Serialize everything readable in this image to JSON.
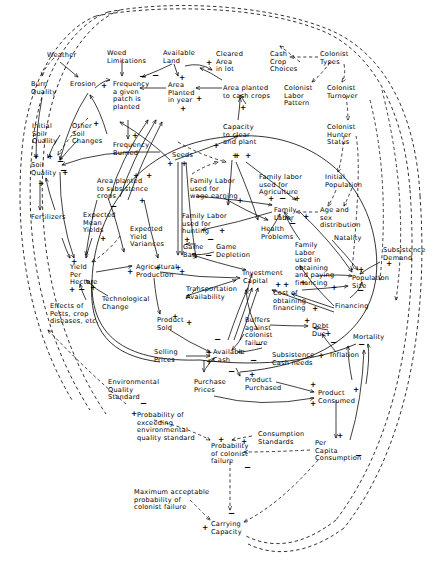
{
  "diagram": {
    "type": "causal-loop-diagram",
    "width": 439,
    "height": 562,
    "link_styles": {
      "causal": "solid",
      "informational": "dashed"
    },
    "polarity_symbols": [
      "+",
      "−"
    ],
    "nodes": [
      {
        "id": "weather",
        "label": "Weather",
        "x": 47,
        "y": 52,
        "align": "left"
      },
      {
        "id": "weed-limitations",
        "label": "Weed\nLimitations",
        "x": 107,
        "y": 50,
        "align": "left"
      },
      {
        "id": "available-land",
        "label": "Available\nLand",
        "x": 163,
        "y": 50,
        "align": "left"
      },
      {
        "id": "cleared-area-in-lot",
        "label": "Cleared\nArea\nin lot",
        "x": 216,
        "y": 51,
        "align": "left"
      },
      {
        "id": "cash-crop-choices",
        "label": "Cash\nCrop\nChoices",
        "x": 270,
        "y": 51,
        "align": "left"
      },
      {
        "id": "colonist-types",
        "label": "Colonist\nTypes",
        "x": 320,
        "y": 51,
        "align": "left"
      },
      {
        "id": "burn-quality",
        "label": "Burn\nQuality",
        "x": 31,
        "y": 81,
        "align": "left"
      },
      {
        "id": "erosion",
        "label": "Erosion",
        "x": 70,
        "y": 81,
        "align": "left"
      },
      {
        "id": "frequency-planted",
        "label": "Frequency\na given\npatch is\nplanted",
        "x": 113,
        "y": 81,
        "align": "left"
      },
      {
        "id": "area-planted-in-year",
        "label": "Area\nPlanted\nin year",
        "x": 168,
        "y": 82,
        "align": "left"
      },
      {
        "id": "area-planted-cash-crops",
        "label": "Area planted\nto cash crops",
        "x": 223,
        "y": 85,
        "align": "left"
      },
      {
        "id": "colonist-labor-pattern",
        "label": "Colonist\nLabor\nPattern",
        "x": 284,
        "y": 85,
        "align": "left"
      },
      {
        "id": "colonist-turnover",
        "label": "Colonist\nTurnover",
        "x": 327,
        "y": 85,
        "align": "left"
      },
      {
        "id": "initial-soil-quality",
        "label": "Initial\nSoil\nQuality",
        "x": 32,
        "y": 123,
        "align": "left"
      },
      {
        "id": "other-soil-changes",
        "label": "Other\nSoil\nChanges",
        "x": 72,
        "y": 123,
        "align": "left"
      },
      {
        "id": "frequency-burned",
        "label": "Frequency\nBurned",
        "x": 113,
        "y": 142,
        "align": "left"
      },
      {
        "id": "capacity-clear-plant",
        "label": "Capacity\nto clear\nand plant",
        "x": 223,
        "y": 124,
        "align": "left"
      },
      {
        "id": "colonist-hunter-status",
        "label": "Colonist\nHunter\nStatus",
        "x": 327,
        "y": 124,
        "align": "left"
      },
      {
        "id": "seeds",
        "label": "Seeds",
        "x": 172,
        "y": 152,
        "align": "left"
      },
      {
        "id": "soil-quality",
        "label": "Soil\nQuality",
        "x": 31,
        "y": 162,
        "align": "left"
      },
      {
        "id": "area-planted-subsistence",
        "label": "Area planted\nto subsistence\ncrops",
        "x": 97,
        "y": 178,
        "align": "left"
      },
      {
        "id": "family-labor-wage",
        "label": "Family Labor\nused for\nwage earning",
        "x": 190,
        "y": 178,
        "align": "left"
      },
      {
        "id": "family-labor-agriculture",
        "label": "Family labor\nused for\nAgriculture",
        "x": 259,
        "y": 174,
        "align": "left"
      },
      {
        "id": "initial-population",
        "label": "Initial\nPopulation",
        "x": 325,
        "y": 174,
        "align": "left"
      },
      {
        "id": "fertilizers",
        "label": "Fertilizers",
        "x": 31,
        "y": 214,
        "align": "left"
      },
      {
        "id": "expected-mean-yields",
        "label": "Expected\nMean\nYields",
        "x": 83,
        "y": 212,
        "align": "left"
      },
      {
        "id": "family-labor-hunting",
        "label": "Family Labor\nused for\nhunting",
        "x": 182,
        "y": 213,
        "align": "left"
      },
      {
        "id": "family-labor",
        "label": "Family\nLabor",
        "x": 274,
        "y": 207,
        "align": "left"
      },
      {
        "id": "age-sex-distribution",
        "label": "Age and\nsex\ndistribution",
        "x": 320,
        "y": 207,
        "align": "left"
      },
      {
        "id": "expected-yield-variances",
        "label": "Expected\nYield\nVariances",
        "x": 130,
        "y": 226,
        "align": "left"
      },
      {
        "id": "health-problems",
        "label": "Health\nProblems",
        "x": 261,
        "y": 226,
        "align": "left"
      },
      {
        "id": "natality",
        "label": "Natality",
        "x": 334,
        "y": 235,
        "align": "left"
      },
      {
        "id": "game-bag",
        "label": "Game\nBag",
        "x": 183,
        "y": 244,
        "align": "left"
      },
      {
        "id": "game-depletion",
        "label": "Game\nDepletion",
        "x": 216,
        "y": 244,
        "align": "left"
      },
      {
        "id": "family-labor-financing",
        "label": "Family\nLabor\nused in\nobtaining\nand paying\nfinancing",
        "x": 295,
        "y": 242,
        "align": "left"
      },
      {
        "id": "subsistence-demand",
        "label": "Subsistence\nDemand",
        "x": 383,
        "y": 247,
        "align": "left"
      },
      {
        "id": "yield-per-hectare",
        "label": "Yield\nPer\nHectare",
        "x": 70,
        "y": 264,
        "align": "left"
      },
      {
        "id": "agricultural-production",
        "label": "Agricultural\nProduction",
        "x": 136,
        "y": 264,
        "align": "left"
      },
      {
        "id": "investment-capital",
        "label": "Investment\nCapital",
        "x": 243,
        "y": 270,
        "align": "left"
      },
      {
        "id": "population-size",
        "label": "Population\nSize",
        "x": 352,
        "y": 275,
        "align": "left"
      },
      {
        "id": "technological-change",
        "label": "Technological\nChange",
        "x": 102,
        "y": 296,
        "align": "left"
      },
      {
        "id": "transportation-availability",
        "label": "Transportation\nAvailability",
        "x": 186,
        "y": 286,
        "align": "left"
      },
      {
        "id": "cost-obtaining-financing",
        "label": "Cost of\nobtaining\nfinancing",
        "x": 273,
        "y": 290,
        "align": "left"
      },
      {
        "id": "financing",
        "label": "Financing",
        "x": 335,
        "y": 303,
        "align": "left"
      },
      {
        "id": "effects-pests",
        "label": "Effects of\nPests, crop\ndiseases, etc.",
        "x": 50,
        "y": 303,
        "align": "left"
      },
      {
        "id": "buffers-against-failure",
        "label": "Buffers\nagainst\ncolonist\nfailure",
        "x": 245,
        "y": 317,
        "align": "left"
      },
      {
        "id": "debt-due",
        "label": "Debt\nDue",
        "x": 312,
        "y": 323,
        "align": "left"
      },
      {
        "id": "product-sold",
        "label": "Product\nSold",
        "x": 157,
        "y": 317,
        "align": "left"
      },
      {
        "id": "mortality",
        "label": "Mortality",
        "x": 353,
        "y": 334,
        "align": "left"
      },
      {
        "id": "selling-prices",
        "label": "Selling\nPrices",
        "x": 154,
        "y": 349,
        "align": "left"
      },
      {
        "id": "available-cash",
        "label": "Available\nCash",
        "x": 213,
        "y": 349,
        "align": "left"
      },
      {
        "id": "subsistence-cash-needs",
        "label": "Subsistence\nCash needs",
        "x": 272,
        "y": 352,
        "align": "left"
      },
      {
        "id": "inflation",
        "label": "Inflation",
        "x": 330,
        "y": 352,
        "align": "left"
      },
      {
        "id": "purchase-prices",
        "label": "Purchase\nPrices",
        "x": 194,
        "y": 379,
        "align": "left"
      },
      {
        "id": "product-purchased",
        "label": "Product\nPurchased",
        "x": 245,
        "y": 377,
        "align": "left"
      },
      {
        "id": "environmental-quality-standard",
        "label": "Environmental\nQuality\nStandard",
        "x": 108,
        "y": 379,
        "align": "left"
      },
      {
        "id": "product-consumed",
        "label": "Product\nConsumed",
        "x": 318,
        "y": 390,
        "align": "left"
      },
      {
        "id": "prob-exceeding-eq-standard",
        "label": "Probability of\nexceeding\nenvironmental\nquality standard",
        "x": 137,
        "y": 412,
        "align": "left"
      },
      {
        "id": "consumption-standards",
        "label": "Consumption\nStandards",
        "x": 258,
        "y": 431,
        "align": "left"
      },
      {
        "id": "per-capita-consumption",
        "label": "Per\nCapita\nConsumption",
        "x": 315,
        "y": 440,
        "align": "left"
      },
      {
        "id": "probability-colonist-failure",
        "label": "Probability\nof colonist\nfailure",
        "x": 211,
        "y": 443,
        "align": "left"
      },
      {
        "id": "max-acceptable-prob-failure",
        "label": "Maximum acceptable\nprobability of\ncolonist  failure",
        "x": 134,
        "y": 489,
        "align": "left"
      },
      {
        "id": "carrying-capacity",
        "label": "Carrying\nCapacity",
        "x": 211,
        "y": 521,
        "align": "left"
      }
    ],
    "signs": [
      {
        "s": "+",
        "x": 101,
        "y": 82
      },
      {
        "s": "−",
        "x": 139,
        "y": 73
      },
      {
        "s": "−",
        "x": 152,
        "y": 72
      },
      {
        "s": "+",
        "x": 179,
        "y": 74
      },
      {
        "s": "+",
        "x": 206,
        "y": 59
      },
      {
        "s": "+",
        "x": 196,
        "y": 95
      },
      {
        "s": "+",
        "x": 180,
        "y": 105
      },
      {
        "s": "+",
        "x": 240,
        "y": 104
      },
      {
        "s": "+",
        "x": 93,
        "y": 120
      },
      {
        "s": "+",
        "x": 132,
        "y": 132
      },
      {
        "s": "+",
        "x": 213,
        "y": 142
      },
      {
        "s": "+",
        "x": 33,
        "y": 153
      },
      {
        "s": "+",
        "x": 47,
        "y": 153
      },
      {
        "s": "−",
        "x": 57,
        "y": 158
      },
      {
        "s": "−",
        "x": 60,
        "y": 167
      },
      {
        "s": "+",
        "x": 62,
        "y": 169
      },
      {
        "s": "+",
        "x": 38,
        "y": 180
      },
      {
        "s": "+",
        "x": 167,
        "y": 160
      },
      {
        "s": "+",
        "x": 181,
        "y": 160
      },
      {
        "s": "+",
        "x": 232,
        "y": 152
      },
      {
        "s": "+",
        "x": 234,
        "y": 152
      },
      {
        "s": "+",
        "x": 245,
        "y": 152
      },
      {
        "s": "+",
        "x": 133,
        "y": 172
      },
      {
        "s": "+",
        "x": 146,
        "y": 172
      },
      {
        "s": "+",
        "x": 139,
        "y": 197
      },
      {
        "s": "−",
        "x": 110,
        "y": 203
      },
      {
        "s": "+",
        "x": 237,
        "y": 197
      },
      {
        "s": "+",
        "x": 268,
        "y": 195
      },
      {
        "s": "−",
        "x": 279,
        "y": 195
      },
      {
        "s": "+",
        "x": 294,
        "y": 195
      },
      {
        "s": "+",
        "x": 100,
        "y": 235
      },
      {
        "s": "+",
        "x": 303,
        "y": 213
      },
      {
        "s": "−",
        "x": 289,
        "y": 220
      },
      {
        "s": "+",
        "x": 219,
        "y": 227
      },
      {
        "s": "+",
        "x": 184,
        "y": 236
      },
      {
        "s": "−",
        "x": 207,
        "y": 236
      },
      {
        "s": "−",
        "x": 205,
        "y": 252
      },
      {
        "s": "+",
        "x": 71,
        "y": 258
      },
      {
        "s": "+",
        "x": 127,
        "y": 268
      },
      {
        "s": "+",
        "x": 155,
        "y": 264
      },
      {
        "s": "+",
        "x": 175,
        "y": 264
      },
      {
        "s": "+",
        "x": 179,
        "y": 268
      },
      {
        "s": "+",
        "x": 69,
        "y": 286
      },
      {
        "s": "−",
        "x": 78,
        "y": 286
      },
      {
        "s": "+",
        "x": 90,
        "y": 284
      },
      {
        "s": "+",
        "x": 275,
        "y": 281
      },
      {
        "s": "+",
        "x": 283,
        "y": 281
      },
      {
        "s": "+",
        "x": 300,
        "y": 279
      },
      {
        "s": "+",
        "x": 331,
        "y": 284
      },
      {
        "s": "+",
        "x": 312,
        "y": 305
      },
      {
        "s": "+",
        "x": 386,
        "y": 260
      },
      {
        "s": "+",
        "x": 358,
        "y": 266
      },
      {
        "s": "−",
        "x": 357,
        "y": 287
      },
      {
        "s": "+",
        "x": 172,
        "y": 313
      },
      {
        "s": "+",
        "x": 186,
        "y": 319
      },
      {
        "s": "+",
        "x": 304,
        "y": 317
      },
      {
        "s": "+",
        "x": 325,
        "y": 330
      },
      {
        "s": "−",
        "x": 330,
        "y": 339
      },
      {
        "s": "−",
        "x": 214,
        "y": 336
      },
      {
        "s": "−",
        "x": 255,
        "y": 341
      },
      {
        "s": "+",
        "x": 206,
        "y": 349
      },
      {
        "s": "+",
        "x": 206,
        "y": 358
      },
      {
        "s": "−",
        "x": 250,
        "y": 357
      },
      {
        "s": "+",
        "x": 318,
        "y": 352
      },
      {
        "s": "−",
        "x": 358,
        "y": 341
      },
      {
        "s": "−",
        "x": 228,
        "y": 368
      },
      {
        "s": "+",
        "x": 249,
        "y": 371
      },
      {
        "s": "+",
        "x": 310,
        "y": 381
      },
      {
        "s": "+",
        "x": 353,
        "y": 386
      },
      {
        "s": "+",
        "x": 310,
        "y": 400
      },
      {
        "s": "+",
        "x": 131,
        "y": 410
      },
      {
        "s": "−",
        "x": 140,
        "y": 400
      },
      {
        "s": "+",
        "x": 218,
        "y": 436
      },
      {
        "s": "+",
        "x": 241,
        "y": 438
      },
      {
        "s": "+",
        "x": 337,
        "y": 432
      },
      {
        "s": "−",
        "x": 355,
        "y": 452
      },
      {
        "s": "−",
        "x": 244,
        "y": 464
      },
      {
        "s": "−",
        "x": 228,
        "y": 510
      },
      {
        "s": "+",
        "x": 202,
        "y": 524
      }
    ]
  }
}
